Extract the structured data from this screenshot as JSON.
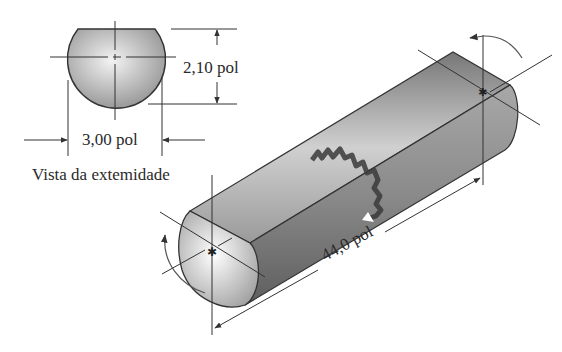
{
  "figure": {
    "end_view": {
      "caption": "Vista da extemidade",
      "height_dimension": "2,10 pol",
      "width_dimension": "3,00 pol"
    },
    "shaft": {
      "length_dimension": "44,0 pol",
      "features": [
        "flat-face",
        "break-line",
        "torque-arrow-left",
        "torque-arrow-right",
        "centerlines"
      ]
    },
    "colors": {
      "line": "#333333",
      "shade_dark": "#6e6e6e",
      "shade_light": "#d9d9d9",
      "background": "#ffffff"
    }
  }
}
